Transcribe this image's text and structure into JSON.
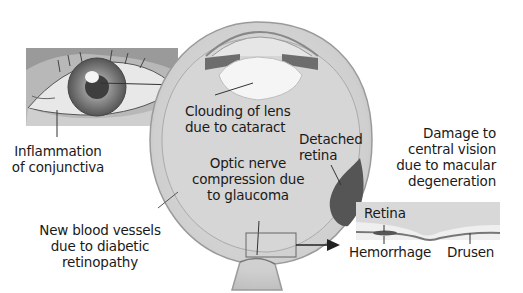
{
  "diagram": {
    "labels": {
      "inflammation": [
        "Inflammation",
        "of conjunctiva"
      ],
      "cataract": [
        "Clouding of lens",
        "due to cataract"
      ],
      "detached": [
        "Detached",
        "retina"
      ],
      "macular": [
        "Damage to",
        "central vision",
        "due to macular",
        "degeneration"
      ],
      "glaucoma": [
        "Optic nerve",
        "compression due",
        "to glaucoma"
      ],
      "diabetic": [
        "New blood vessels",
        "due to diabetic",
        "retinopathy"
      ],
      "inset_retina": "Retina",
      "inset_hemorrhage": "Hemorrhage",
      "inset_drusen": "Drusen"
    },
    "colors": {
      "eyeball_fill": "#d9d9d9",
      "sclera": "#c4c4c4",
      "lens": "#f4f4f4",
      "detached_retina": "#555555",
      "label_text": "#1a1a1a"
    }
  }
}
